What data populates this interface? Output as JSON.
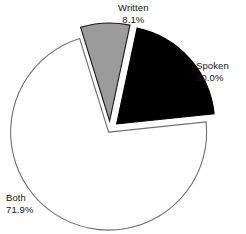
{
  "chart_data": {
    "type": "pie",
    "title": "",
    "subtitle": "",
    "xlabel": "",
    "ylabel": "",
    "grid": false,
    "legend": "none",
    "labels_position": "outside",
    "categories": [
      "Written",
      "Spoken",
      "Both"
    ],
    "values": [
      8.1,
      20.0,
      71.9
    ],
    "units": "percent",
    "slices": [
      {
        "name": "Written",
        "value": 8.1,
        "label": "Written",
        "percent_label": "8.1%",
        "color": "#9b9b9b",
        "edge_color": "#1a1a1a",
        "exploded": true,
        "start_angle_deg": -17.2,
        "end_angle_deg": 12.0
      },
      {
        "name": "Spoken",
        "value": 20.0,
        "label": "Spoken",
        "percent_label": "20.0%",
        "color": "#000000",
        "edge_color": "#000000",
        "exploded": true,
        "start_angle_deg": 12.0,
        "end_angle_deg": 84.0
      },
      {
        "name": "Both",
        "value": 71.9,
        "label": "Both",
        "percent_label": "71.9%",
        "color": "#ffffff",
        "edge_color": "#6e6e6e",
        "exploded": false,
        "start_angle_deg": 84.0,
        "end_angle_deg": 342.8
      }
    ],
    "background_color": "#ffffff",
    "total": 100.0
  }
}
